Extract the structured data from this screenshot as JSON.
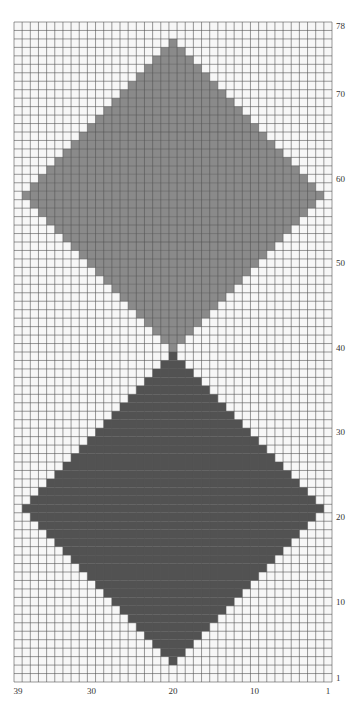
{
  "chart_data": {
    "type": "heatmap",
    "title": "",
    "columns": 39,
    "rows": 78,
    "x_axis": {
      "direction": "right-to-left",
      "tick_labels": [
        "39",
        "30",
        "20",
        "10",
        "1"
      ],
      "tick_values": [
        39,
        30,
        20,
        10,
        1
      ]
    },
    "y_axis": {
      "direction": "bottom-to-top",
      "position": "right",
      "tick_labels": [
        "1",
        "10",
        "20",
        "30",
        "40",
        "50",
        "60",
        "70",
        "78"
      ],
      "tick_values": [
        1,
        10,
        20,
        30,
        40,
        50,
        60,
        70,
        78
      ]
    },
    "grid": true,
    "colors": {
      "background": "#f7f7f7",
      "grid_line": "#555555",
      "light_fill": "#8a8a8a",
      "dark_fill": "#525252"
    },
    "shapes": [
      {
        "name": "light-diamond",
        "color": "light",
        "center_col": 20,
        "top_row": 76,
        "widest_row": 58,
        "bottom_row": 40,
        "half_width": 18
      },
      {
        "name": "dark-diamond",
        "color": "dark",
        "center_col": 20,
        "top_row": 39,
        "widest_row": 21,
        "bottom_row": 3,
        "half_width": 18
      }
    ]
  }
}
